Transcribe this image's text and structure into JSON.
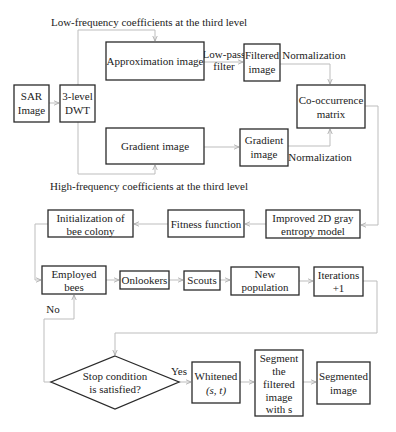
{
  "diagram": {
    "labels": {
      "low_freq": "Low-frequency coefficients at the third level",
      "high_freq": "High-frequency coefficients at the third level",
      "low_pass_1": "Low-pass",
      "low_pass_2": "filter",
      "normalization_top": "Normalization",
      "normalization_bottom": "Normalization",
      "no": "No",
      "yes": "Yes"
    },
    "nodes": {
      "sar": [
        "SAR",
        "Image"
      ],
      "dwt": [
        "3-level",
        "DWT"
      ],
      "approx": [
        "Approximation image"
      ],
      "filtered": [
        "Filtered",
        "image"
      ],
      "cooc": [
        "Co-occurrence",
        "matrix"
      ],
      "gradient_big": [
        "Gradient image"
      ],
      "gradient_small": [
        "Gradient",
        "image"
      ],
      "improved": [
        "Improved 2D gray",
        "entropy model"
      ],
      "fitness": [
        "Fitness function"
      ],
      "init": [
        "Initialization of",
        "bee colony"
      ],
      "employed": [
        "Employed",
        "bees"
      ],
      "onlookers": [
        "Onlookers"
      ],
      "scouts": [
        "Scouts"
      ],
      "newpop": [
        "New",
        "population"
      ],
      "iterations": [
        "Iterations",
        "+1"
      ],
      "stop": [
        "Stop condition",
        "is satisfied?"
      ],
      "whitened": [
        "Whitened",
        "(s, t)"
      ],
      "segment": [
        "Segment",
        "the",
        "filtered",
        "image",
        "with s"
      ],
      "segmented": [
        "Segmented",
        "image"
      ]
    }
  }
}
